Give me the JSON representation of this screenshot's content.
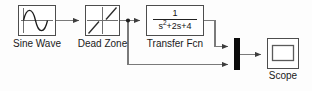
{
  "diagram": {
    "type": "block-diagram",
    "width": 312,
    "height": 91,
    "background_color": "#fdfdfd",
    "line_color": "#707070",
    "block_border_color": "#4d4d4d",
    "block_fill_color": "#ffffff",
    "mux_color": "#0b0b0b",
    "text_color": "#1a1a1a"
  },
  "blocks": [
    {
      "id": "sine-wave",
      "label": "Sine Wave",
      "icon": "sine-wave-icon",
      "x": 18,
      "y": 5,
      "w": 38,
      "h": 31,
      "label_x": 12,
      "label_y": 38
    },
    {
      "id": "dead-zone",
      "label": "Dead Zone",
      "icon": "dead-zone-icon",
      "x": 85,
      "y": 5,
      "w": 35,
      "h": 31,
      "label_x": 78,
      "label_y": 38
    },
    {
      "id": "transfer-fcn",
      "label": "Transfer Fcn",
      "icon": "transfer-function-icon",
      "numerator": "1",
      "denominator_base": "s",
      "denominator_exponent": "2",
      "denominator_rest": "+2s+4",
      "denominator_plain": "s2+2s+4",
      "expression": "1/(s^2+2s+4)",
      "x": 146,
      "y": 5,
      "w": 58,
      "h": 31,
      "label_x": 144,
      "label_y": 38
    },
    {
      "id": "mux",
      "label": "",
      "icon": "mux-bar-icon",
      "x": 234,
      "y": 38,
      "w": 6,
      "h": 32
    },
    {
      "id": "scope",
      "label": "Scope",
      "icon": "scope-icon",
      "x": 267,
      "y": 38,
      "w": 32,
      "h": 31,
      "label_x": 263,
      "label_y": 71
    }
  ],
  "signals": [
    {
      "id": "sine-to-deadzone",
      "from": "sine-wave",
      "to": "dead-zone"
    },
    {
      "id": "deadzone-to-branch",
      "from": "dead-zone",
      "to": "branch-point"
    },
    {
      "id": "branch-to-transferfcn",
      "from": "branch-point",
      "to": "transfer-fcn"
    },
    {
      "id": "branch-to-mux-lower",
      "from": "branch-point",
      "to": "mux"
    },
    {
      "id": "transferfcn-to-mux-upper",
      "from": "transfer-fcn",
      "to": "mux"
    },
    {
      "id": "mux-to-scope",
      "from": "mux",
      "to": "scope"
    }
  ],
  "branch_point": {
    "x": 128,
    "y": 20
  }
}
